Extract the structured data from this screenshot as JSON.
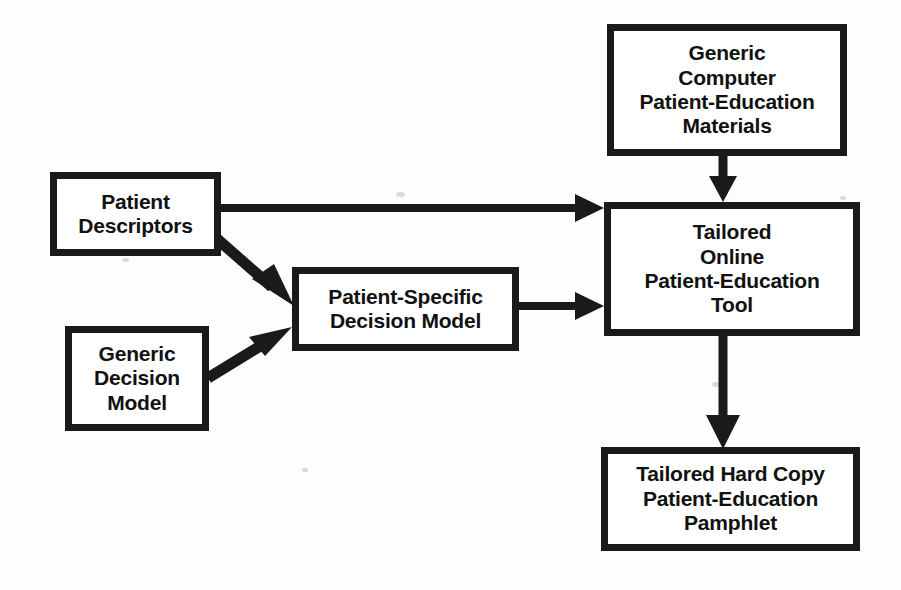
{
  "diagram": {
    "type": "flowchart",
    "background_color": "#fdfdfc",
    "stroke_color": "#1a1a1a",
    "nodes": [
      {
        "id": "generic-materials",
        "label": "Generic\nComputer\nPatient-Education\nMaterials",
        "x": 607,
        "y": 24,
        "width": 240,
        "height": 132
      },
      {
        "id": "patient-descriptors",
        "label": "Patient\nDescriptors",
        "x": 50,
        "y": 172,
        "width": 171,
        "height": 84
      },
      {
        "id": "generic-decision",
        "label": "Generic\nDecision\nModel",
        "x": 65,
        "y": 326,
        "width": 144,
        "height": 105
      },
      {
        "id": "patient-specific",
        "label": "Patient-Specific\nDecision Model",
        "x": 292,
        "y": 267,
        "width": 227,
        "height": 84
      },
      {
        "id": "tailored-online",
        "label": "Tailored\nOnline\nPatient-Education\nTool",
        "x": 604,
        "y": 202,
        "width": 256,
        "height": 134
      },
      {
        "id": "tailored-hardcopy",
        "label": "Tailored Hard Copy\nPatient-Education\nPamphlet",
        "x": 601,
        "y": 447,
        "width": 259,
        "height": 104
      }
    ],
    "edges": [
      {
        "id": "edge-materials-to-online",
        "from": "generic-materials",
        "to": "tailored-online",
        "style": "straight-vertical",
        "arrowhead": "filled-triangle"
      },
      {
        "id": "edge-descriptors-to-online",
        "from": "patient-descriptors",
        "to": "tailored-online",
        "style": "straight-horizontal",
        "arrowhead": "filled-triangle"
      },
      {
        "id": "edge-descriptors-to-specific",
        "from": "patient-descriptors",
        "to": "patient-specific",
        "style": "diagonal-down-right",
        "arrowhead": "filled-triangle"
      },
      {
        "id": "edge-generic-decision-to-specific",
        "from": "generic-decision",
        "to": "patient-specific",
        "style": "diagonal-up-right",
        "arrowhead": "filled-triangle"
      },
      {
        "id": "edge-specific-to-online",
        "from": "patient-specific",
        "to": "tailored-online",
        "style": "straight-horizontal",
        "arrowhead": "filled-triangle"
      },
      {
        "id": "edge-online-to-hardcopy",
        "from": "tailored-online",
        "to": "tailored-hardcopy",
        "style": "straight-vertical",
        "arrowhead": "filled-triangle"
      }
    ]
  }
}
